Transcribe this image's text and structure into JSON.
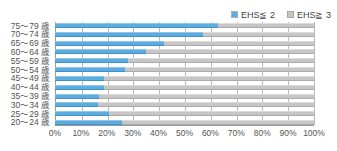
{
  "chart_data": {
    "type": "bar",
    "orientation": "horizontal",
    "stacked": true,
    "stacked_mode": "percent",
    "title": "",
    "xlabel": "",
    "ylabel": "",
    "xlim": [
      0,
      100
    ],
    "grid": true,
    "legend_position": "top-right",
    "xtick_labels": [
      "0%",
      "10%",
      "20%",
      "30%",
      "40%",
      "50%",
      "60%",
      "70%",
      "80%",
      "90%",
      "100%"
    ],
    "xticks": [
      0,
      10,
      20,
      30,
      40,
      50,
      60,
      70,
      80,
      90,
      100
    ],
    "categories": [
      "75～79 歳",
      "70～74 歳",
      "65～69 歳",
      "60～64 歳",
      "55～59 歳",
      "50～54 歳",
      "45～49 歳",
      "40～44 歳",
      "35～39 歳",
      "30～34 歳",
      "25～29 歳",
      "20～24 歳"
    ],
    "series": [
      {
        "name": "EHS≦ 2",
        "color": "#5cace0",
        "values": [
          63,
          57,
          42,
          35,
          28,
          27,
          19,
          19,
          17,
          16.5,
          21,
          26
        ]
      },
      {
        "name": "EHS≧ 3",
        "color": "#c6c6c6",
        "values": [
          37,
          43,
          58,
          65,
          72,
          73,
          81,
          81,
          83,
          83.5,
          79,
          74
        ]
      }
    ]
  },
  "legend": {
    "items": [
      {
        "label": "EHS≦ 2",
        "swatch": "blue"
      },
      {
        "label": "EHS≧ 3",
        "swatch": "gray"
      }
    ]
  },
  "colors": {
    "series_low": "#5cace0",
    "series_high": "#c6c6c6",
    "axis": "#9a9a9a",
    "gridline": "#b9b9b9",
    "text": "#545454"
  }
}
